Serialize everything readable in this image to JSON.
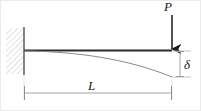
{
  "figure": {
    "type": "engineering-diagram",
    "width": 201,
    "height": 111,
    "background_color": "#ffffff",
    "border_color": "#e8e8e8"
  },
  "labels": {
    "load": "P",
    "length": "L",
    "deflection": "δ"
  },
  "colors": {
    "beam": "#2b2b2b",
    "wall": "#555555",
    "hatch": "#d9d9d9",
    "curve": "#7a7a7a",
    "dimension": "#9a9a9a",
    "arrow": "#1a1a1a",
    "text": "#1a1a1a"
  },
  "geometry": {
    "wall": {
      "x": 6,
      "y": 28,
      "width": 18,
      "height": 46
    },
    "wall_face_x": 24,
    "beam": {
      "x1": 24,
      "y1": 50.5,
      "x2": 172,
      "y2": 50.5
    },
    "load_arrow": {
      "x": 172,
      "y_start": 14,
      "y_end": 50
    },
    "deflection_curve": {
      "start_x": 24,
      "start_y": 51,
      "end_x": 172,
      "end_y": 77
    },
    "delta_dimension": {
      "x": 180,
      "y_top": 51,
      "y_bottom": 77
    },
    "length_dimension": {
      "y": 93,
      "x_left": 24,
      "x_right": 172
    }
  },
  "annotations": [
    {
      "name": "load-label",
      "text": "P",
      "meaning": "applied point load at free end"
    },
    {
      "name": "length-label",
      "text": "L",
      "meaning": "beam span length"
    },
    {
      "name": "deflection-label",
      "text": "δ",
      "meaning": "tip deflection"
    }
  ]
}
